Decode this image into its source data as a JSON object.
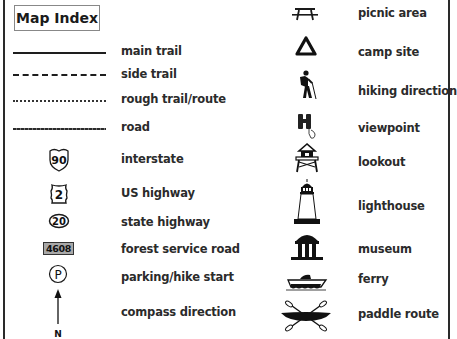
{
  "title": "Map Index",
  "left_column": [
    {
      "symbol": "solid-line",
      "label": "main trail"
    },
    {
      "symbol": "dashed-line",
      "label": "side trail"
    },
    {
      "symbol": "dotted-line",
      "label": "rough trail/route"
    },
    {
      "symbol": "fine-dash-line",
      "label": "road"
    },
    {
      "symbol": "interstate-shield",
      "badge": "90",
      "label": "interstate"
    },
    {
      "symbol": "us-highway-shield",
      "badge": "2",
      "label": "US highway"
    },
    {
      "symbol": "state-highway-oval",
      "badge": "20",
      "label": "state highway"
    },
    {
      "symbol": "forest-road-box",
      "badge": "4608",
      "label": "forest service road"
    },
    {
      "symbol": "parking-icon",
      "badge": "P",
      "label": "parking/hike start"
    },
    {
      "symbol": "north-arrow-icon",
      "badge": "N",
      "label": "compass direction"
    }
  ],
  "right_column": [
    {
      "symbol": "picnic-table-icon",
      "label": "picnic area"
    },
    {
      "symbol": "campsite-triangle-icon",
      "label": "camp site"
    },
    {
      "symbol": "hiker-icon",
      "label": "hiking direction"
    },
    {
      "symbol": "binoculars-icon",
      "label": "viewpoint"
    },
    {
      "symbol": "lookout-tower-icon",
      "label": "lookout"
    },
    {
      "symbol": "lighthouse-icon",
      "label": "lighthouse"
    },
    {
      "symbol": "museum-icon",
      "label": "museum"
    },
    {
      "symbol": "ferry-icon",
      "label": "ferry"
    },
    {
      "symbol": "kayak-paddles-icon",
      "label": "paddle route"
    }
  ]
}
